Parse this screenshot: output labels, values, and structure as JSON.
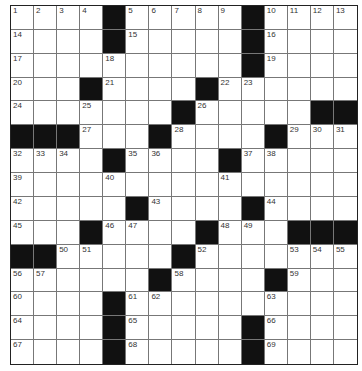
{
  "puzzle": {
    "rows": 15,
    "cols": 15,
    "grid": [
      [
        "1",
        "2",
        "3",
        "4",
        "#",
        "5",
        "6",
        "7",
        "8",
        "9",
        "#",
        "10",
        "11",
        "12",
        "13"
      ],
      [
        "14",
        "",
        "",
        "",
        "#",
        "15",
        "",
        "",
        "",
        "",
        "#",
        "16",
        "",
        "",
        ""
      ],
      [
        "17",
        "",
        "",
        "",
        "18",
        "",
        "",
        "",
        "",
        "",
        "#",
        "19",
        "",
        "",
        ""
      ],
      [
        "20",
        "",
        "",
        "#",
        "21",
        "",
        "",
        "",
        "#",
        "22",
        "23",
        "",
        "",
        "",
        ""
      ],
      [
        "24",
        "",
        "",
        "25",
        "",
        "",
        "",
        "#",
        "26",
        "",
        "",
        "",
        "",
        "#",
        "#"
      ],
      [
        "#",
        "#",
        "#",
        "27",
        "",
        "",
        "#",
        "28",
        "",
        "",
        "",
        "#",
        "29",
        "30",
        "31"
      ],
      [
        "32",
        "33",
        "34",
        "",
        "#",
        "35",
        "36",
        "",
        "",
        "#",
        "37",
        "38",
        "",
        "",
        ""
      ],
      [
        "39",
        "",
        "",
        "",
        "40",
        "",
        "",
        "",
        "",
        "41",
        "",
        "",
        "",
        "",
        ""
      ],
      [
        "42",
        "",
        "",
        "",
        "",
        "#",
        "43",
        "",
        "",
        "",
        "#",
        "44",
        "",
        "",
        ""
      ],
      [
        "45",
        "",
        "",
        "#",
        "46",
        "47",
        "",
        "",
        "#",
        "48",
        "49",
        "",
        "#",
        "#",
        "#"
      ],
      [
        "#",
        "#",
        "50",
        "51",
        "",
        "",
        "",
        "#",
        "52",
        "",
        "",
        "",
        "53",
        "54",
        "55"
      ],
      [
        "56",
        "57",
        "",
        "",
        "",
        "",
        "#",
        "58",
        "",
        "",
        "",
        "#",
        "59",
        "",
        ""
      ],
      [
        "60",
        "",
        "",
        "",
        "#",
        "61",
        "62",
        "",
        "",
        "",
        "",
        "63",
        "",
        "",
        ""
      ],
      [
        "64",
        "",
        "",
        "",
        "#",
        "65",
        "",
        "",
        "",
        "",
        "#",
        "66",
        "",
        "",
        ""
      ],
      [
        "67",
        "",
        "",
        "",
        "#",
        "68",
        "",
        "",
        "",
        "",
        "#",
        "69",
        "",
        "",
        ""
      ]
    ]
  }
}
